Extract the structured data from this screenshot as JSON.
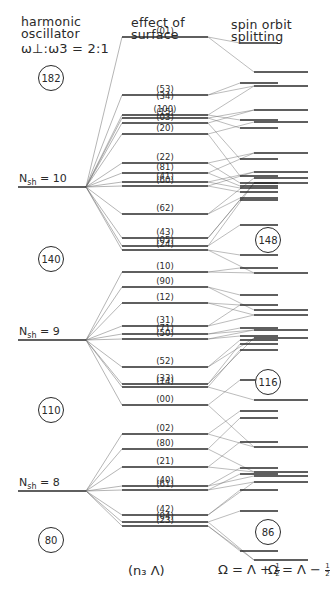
{
  "headers": {
    "harmonic_oscillator": [
      "harmonic",
      "oscillator",
      "ω⊥:ω3 = 2:1"
    ],
    "surface": [
      "effect of",
      "surface"
    ],
    "spin_orbit": [
      "spin orbit",
      "splitting"
    ]
  },
  "shells": [
    {
      "label_main": "N",
      "label_sub": "sh",
      "label_value": "= 10",
      "y": 187
    },
    {
      "label_main": "N",
      "label_sub": "sh",
      "label_value": "= 9",
      "y": 340
    },
    {
      "label_main": "N",
      "label_sub": "sh",
      "label_value": "= 8",
      "y": 491
    }
  ],
  "magic_numbers_left": [
    {
      "value": "182",
      "y": 77
    },
    {
      "value": "140",
      "y": 258
    },
    {
      "value": "110",
      "y": 409
    },
    {
      "value": "80",
      "y": 539
    }
  ],
  "magic_numbers_right": [
    {
      "value": "148",
      "y": 239
    },
    {
      "value": "116",
      "y": 381
    },
    {
      "value": "86",
      "y": 531
    }
  ],
  "surface_levels": [
    {
      "label": "(01)",
      "y": 37,
      "shell": 0
    },
    {
      "label": "(53)",
      "y": 95,
      "shell": 0
    },
    {
      "label": "(34)",
      "y": 102,
      "shell": 0,
      "label_only": true
    },
    {
      "label": "(100)",
      "y": 115,
      "shell": 0
    },
    {
      "label": "(15)",
      "y": 118,
      "shell": 0
    },
    {
      "label": "(03)",
      "y": 123,
      "shell": 0
    },
    {
      "label": "(20)",
      "y": 134,
      "shell": 0
    },
    {
      "label": "(22)",
      "y": 163,
      "shell": 0
    },
    {
      "label": "(81)",
      "y": 173,
      "shell": 0
    },
    {
      "label": "(41)",
      "y": 182,
      "shell": 0
    },
    {
      "label": "(60)",
      "y": 186,
      "shell": 0
    },
    {
      "label": "(62)",
      "y": 214,
      "shell": 0
    },
    {
      "label": "(43)",
      "y": 238,
      "shell": 0
    },
    {
      "label": "(05)",
      "y": 246,
      "shell": 0
    },
    {
      "label": "(24)",
      "y": 250,
      "shell": 0
    },
    {
      "label": "(10)",
      "y": 272,
      "shell": 1
    },
    {
      "label": "(90)",
      "y": 287,
      "shell": 1
    },
    {
      "label": "(12)",
      "y": 303,
      "shell": 1
    },
    {
      "label": "(31)",
      "y": 326,
      "shell": 1
    },
    {
      "label": "(71)",
      "y": 334,
      "shell": 1
    },
    {
      "label": "(50)",
      "y": 339,
      "shell": 1
    },
    {
      "label": "(52)",
      "y": 367,
      "shell": 1
    },
    {
      "label": "(33)",
      "y": 384,
      "shell": 1
    },
    {
      "label": "(14)",
      "y": 387,
      "shell": 1
    },
    {
      "label": "(00)",
      "y": 405,
      "shell": 1
    },
    {
      "label": "(02)",
      "y": 434,
      "shell": 2
    },
    {
      "label": "(80)",
      "y": 449,
      "shell": 2
    },
    {
      "label": "(21)",
      "y": 467,
      "shell": 2
    },
    {
      "label": "(40)",
      "y": 486,
      "shell": 2
    },
    {
      "label": "(61)",
      "y": 490,
      "shell": 2
    },
    {
      "label": "(42)",
      "y": 515,
      "shell": 2
    },
    {
      "label": "(04)",
      "y": 522,
      "shell": 2
    },
    {
      "label": "(23)",
      "y": 526,
      "shell": 2
    }
  ],
  "spin_orbit_levels": {
    "plus_half": [
      43,
      83,
      120,
      128,
      159,
      176,
      183,
      186,
      188,
      192,
      198,
      200,
      225,
      255,
      268,
      295,
      305,
      328,
      336,
      340,
      344,
      350,
      380,
      411,
      418,
      442,
      468,
      474,
      490,
      511,
      551
    ],
    "minus_half": [
      72,
      86,
      110,
      122,
      153,
      172,
      178,
      183,
      273,
      310,
      315,
      330,
      338,
      400,
      447,
      472,
      476,
      482,
      560
    ]
  },
  "footer": {
    "quantum_numbers": "(n₃ Λ)",
    "omega_plus_prefix": "Ω = Λ +",
    "omega_minus_prefix": "Ω = Λ −",
    "half_num": "1",
    "half_den": "2"
  },
  "colors": {
    "ink": "#2a2a2a",
    "thin_line": "#6a6a6a",
    "background": "#ffffff"
  }
}
